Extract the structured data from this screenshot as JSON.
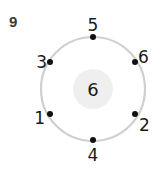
{
  "problem": {
    "number": "9"
  },
  "diagram": {
    "ring_color": "#cfcfcf",
    "inner_fill": "#efefef",
    "dot_color": "#111111",
    "center_value": "6",
    "points": [
      {
        "position": "top",
        "label": "5"
      },
      {
        "position": "upper-right",
        "label": "6"
      },
      {
        "position": "lower-right",
        "label": "2"
      },
      {
        "position": "bottom",
        "label": "4"
      },
      {
        "position": "lower-left",
        "label": "1"
      },
      {
        "position": "upper-left",
        "label": "3"
      }
    ]
  }
}
